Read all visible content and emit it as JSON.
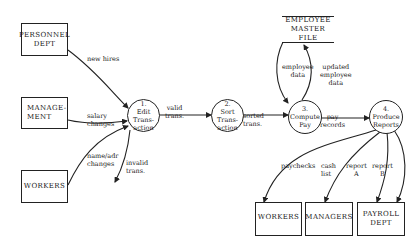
{
  "diagram": {
    "type": "data-flow-diagram",
    "external_entities": [
      {
        "id": "personnel",
        "label": "PERSONNEL\nDEPT"
      },
      {
        "id": "management",
        "label": "MANAGE-\nMENT"
      },
      {
        "id": "workers_in",
        "label": "WORKERS"
      },
      {
        "id": "workers_out",
        "label": "WORKERS"
      },
      {
        "id": "managers_out",
        "label": "MANAGERS"
      },
      {
        "id": "payroll_out",
        "label": "PAYROLL\nDEPT"
      }
    ],
    "processes": [
      {
        "id": "p1",
        "number": "1.",
        "label": "Edit\nTrans-\naction"
      },
      {
        "id": "p2",
        "number": "2.",
        "label": "Sort\nTrans-\naction"
      },
      {
        "id": "p3",
        "number": "3.",
        "label": "Compute\nPay"
      },
      {
        "id": "p4",
        "number": "4.",
        "label": "Produce\nReports"
      }
    ],
    "data_stores": [
      {
        "id": "emf",
        "label": "EMPLOYEE\nMASTER FILE"
      }
    ],
    "flows": [
      {
        "from": "personnel",
        "to": "p1",
        "label": "new hires"
      },
      {
        "from": "management",
        "to": "p1",
        "label": "salary\nchanges"
      },
      {
        "from": "workers_in",
        "to": "p1",
        "label": "name/adr\nchanges"
      },
      {
        "from": "p1",
        "to": "out",
        "label": "invalid\ntrans."
      },
      {
        "from": "p1",
        "to": "p2",
        "label": "valid\ntrans."
      },
      {
        "from": "p2",
        "to": "p3",
        "label": "sorted\ntrans."
      },
      {
        "from": "emf",
        "to": "p3",
        "label": "employee\ndata"
      },
      {
        "from": "p3",
        "to": "emf",
        "label": "updated\nemployee\ndata"
      },
      {
        "from": "p3",
        "to": "p4",
        "label": "pay\nrecords"
      },
      {
        "from": "p4",
        "to": "workers_out",
        "label": "paychecks"
      },
      {
        "from": "p4",
        "to": "managers_out",
        "label": "cash\nlist"
      },
      {
        "from": "p4",
        "to": "payroll_out",
        "label": "report\nA"
      },
      {
        "from": "p4",
        "to": "payroll_out",
        "label": "report\nB"
      }
    ]
  }
}
